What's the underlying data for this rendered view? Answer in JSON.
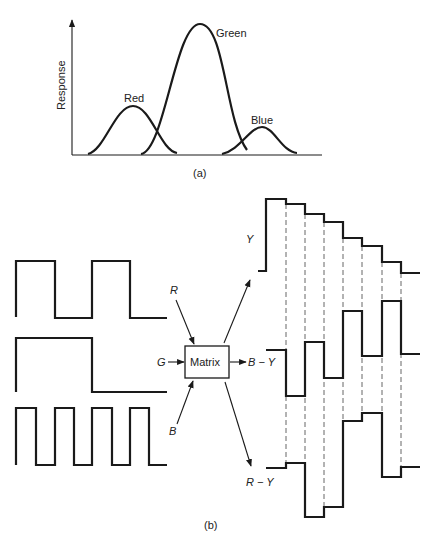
{
  "panel_a": {
    "caption": "(a)",
    "ylabel": "Response",
    "curves": [
      {
        "label": "Red",
        "peak_x": 133,
        "peak_y": 106
      },
      {
        "label": "Green",
        "peak_x": 200,
        "peak_y": 24
      },
      {
        "label": "Blue",
        "peak_x": 262,
        "peak_y": 127
      }
    ]
  },
  "panel_b": {
    "caption": "(b)",
    "inputs": [
      {
        "label": "R",
        "waveform": "square-2-cycles"
      },
      {
        "label": "G",
        "waveform": "square-1-cycle"
      },
      {
        "label": "B",
        "waveform": "square-4-cycles"
      }
    ],
    "matrix_label": "Matrix",
    "outputs": [
      {
        "label": "Y"
      },
      {
        "label": "B − Y"
      },
      {
        "label": "R − Y"
      }
    ]
  }
}
